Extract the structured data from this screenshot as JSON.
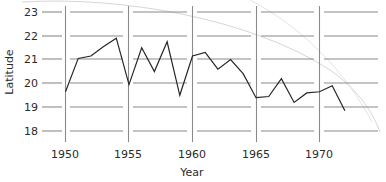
{
  "chart_data": {
    "type": "line",
    "title": "",
    "xlabel": "Year",
    "ylabel": "Latitude",
    "xlim": [
      1949.3,
      1972.6
    ],
    "ylim": [
      17.75,
      23.35
    ],
    "grid": true,
    "legend": null,
    "xticks": [
      1950,
      1955,
      1960,
      1965,
      1970
    ],
    "xticklabels": [
      "1950",
      "1955",
      "1960",
      "1965",
      "1970"
    ],
    "yticks": [
      18,
      19,
      20,
      21,
      22,
      23
    ],
    "yticklabels": [
      "18",
      "19",
      "20",
      "21",
      "22",
      "23"
    ],
    "series": [
      {
        "name": "Latitude",
        "x": [
          1950,
          1951,
          1952,
          1953,
          1954,
          1955,
          1956,
          1957,
          1958,
          1959,
          1960,
          1961,
          1962,
          1963,
          1964,
          1965,
          1966,
          1967,
          1968,
          1969,
          1970,
          1971,
          1972
        ],
        "values": [
          19.65,
          21.05,
          21.15,
          21.55,
          21.9,
          19.95,
          21.5,
          20.5,
          21.75,
          19.5,
          21.15,
          21.3,
          20.6,
          21.0,
          20.4,
          19.4,
          19.45,
          20.2,
          19.2,
          19.6,
          19.65,
          19.9,
          18.85
        ]
      }
    ],
    "annotations": [
      {
        "name": "scan-artifact-arc",
        "description": "faint light grey curved scanning artifact crossing the upper right of the plot"
      }
    ],
    "colors": {
      "line": "#262626",
      "grid": "#8a8a8a",
      "text": "#2b2b2b",
      "artifact": "#d2d2d2",
      "background": "#ffffff"
    }
  }
}
